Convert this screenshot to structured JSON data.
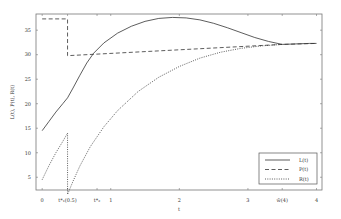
{
  "chart_data": {
    "type": "line",
    "title": "",
    "xlabel": "t",
    "ylabel": "L(t), P(t), R(t)",
    "xlim": [
      -0.09,
      4.08
    ],
    "ylim": [
      2.4,
      38.3
    ],
    "grid": false,
    "legend_position": "bottom-right",
    "x_ticks": [
      {
        "value": 0,
        "label": "0"
      },
      {
        "value": 0.37,
        "label": "t*₁(0.5)"
      },
      {
        "value": 0.8,
        "label": "t*₂"
      },
      {
        "value": 1,
        "label": "1"
      },
      {
        "value": 2,
        "label": "2"
      },
      {
        "value": 3,
        "label": "3"
      },
      {
        "value": 3.5,
        "label": "w̃(4)"
      },
      {
        "value": 4,
        "label": "4"
      }
    ],
    "y_ticks": [
      {
        "value": 5,
        "label": "5"
      },
      {
        "value": 10,
        "label": "10"
      },
      {
        "value": 15,
        "label": "15"
      },
      {
        "value": 20,
        "label": "20"
      },
      {
        "value": 25,
        "label": "25"
      },
      {
        "value": 30,
        "label": "30"
      },
      {
        "value": 35,
        "label": "35"
      }
    ],
    "series": [
      {
        "name": "L(t)",
        "style": "solid",
        "x": [
          0,
          0.1,
          0.2,
          0.3,
          0.37,
          0.45,
          0.55,
          0.65,
          0.75,
          0.9,
          1.1,
          1.3,
          1.5,
          1.7,
          1.9,
          2.1,
          2.3,
          2.5,
          2.7,
          2.9,
          3.1,
          3.3,
          3.5,
          3.7,
          3.9,
          4.0
        ],
        "y": [
          14.5,
          16.4,
          18.3,
          20.0,
          21.2,
          23.2,
          25.8,
          28.3,
          30.3,
          32.4,
          34.4,
          35.8,
          36.8,
          37.4,
          37.6,
          37.5,
          37.1,
          36.4,
          35.5,
          34.5,
          33.5,
          32.7,
          32.1,
          32.2,
          32.3,
          32.3
        ]
      },
      {
        "name": "P(t)",
        "style": "dashed",
        "x": [
          0,
          0.37,
          0.37,
          3.5,
          4.0
        ],
        "y": [
          37.3,
          37.3,
          29.8,
          32.1,
          32.3
        ]
      },
      {
        "name": "R(t)",
        "style": "dotted",
        "x": [
          0,
          0.1,
          0.2,
          0.3,
          0.37,
          0.37,
          0.45,
          0.55,
          0.7,
          0.9,
          1.1,
          1.4,
          1.7,
          2.0,
          2.3,
          2.6,
          2.9,
          3.2,
          3.5
        ],
        "y": [
          4.5,
          7.4,
          10.0,
          12.3,
          14.0,
          1.5,
          4.2,
          7.3,
          11.2,
          15.3,
          18.6,
          22.5,
          25.4,
          27.6,
          29.3,
          30.5,
          31.3,
          31.8,
          32.1
        ]
      }
    ],
    "legend": [
      {
        "label": "L(t)",
        "style": "solid"
      },
      {
        "label": "P(t)",
        "style": "dashed"
      },
      {
        "label": "R(t)",
        "style": "dotted"
      }
    ]
  }
}
